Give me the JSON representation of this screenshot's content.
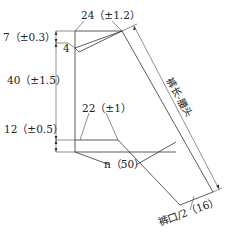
{
  "diagram": {
    "type": "trouser-panel-pattern",
    "colors": {
      "line": "#333333",
      "text": "#222222",
      "background": "#ffffff"
    },
    "labels": {
      "top_width": "24（±1.2）",
      "waist_drop": "7（±0.3）",
      "dart": "4",
      "upper_length": "40（±1.5）",
      "crotch_depth": "12（±0.5）",
      "crotch_width": "22（±1）",
      "thigh": "n（50）",
      "side_length": "裤长-腰头",
      "hem": "裤口/2（16）"
    },
    "dimensions": [
      {
        "name": "top width",
        "value": 24,
        "tolerance": 1.2
      },
      {
        "name": "waist drop",
        "value": 7,
        "tolerance": 0.3
      },
      {
        "name": "dart",
        "value": 4
      },
      {
        "name": "upper length",
        "value": 40,
        "tolerance": 1.5
      },
      {
        "name": "crotch depth",
        "value": 12,
        "tolerance": 0.5
      },
      {
        "name": "crotch width",
        "value": 22,
        "tolerance": 1
      },
      {
        "name": "thigh n",
        "value": 50
      },
      {
        "name": "hem half",
        "value": 16
      }
    ]
  }
}
